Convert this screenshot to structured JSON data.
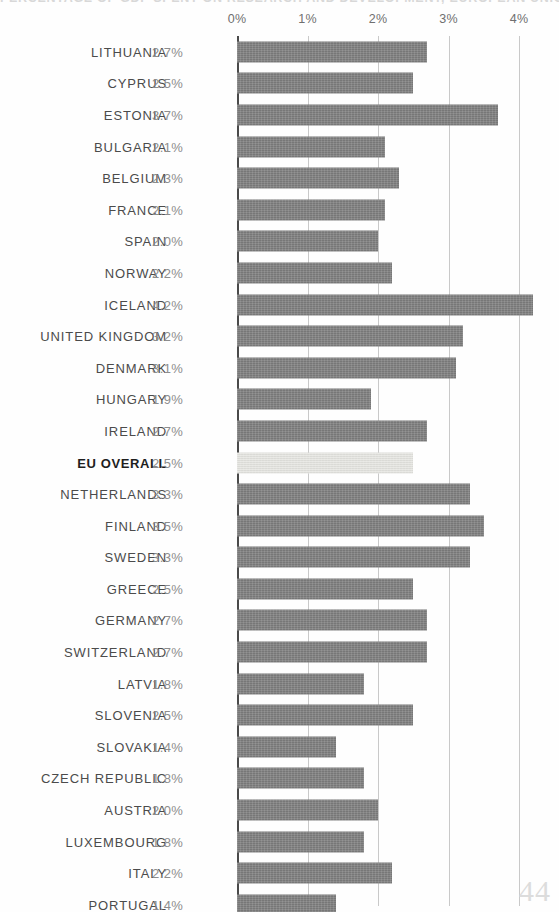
{
  "title": "PERCENTAGE OF GDP SPENT ON RESEARCH AND DEVELOPMENT, EUROPEAN UNION 2012",
  "page_number": "44",
  "axis": {
    "tick_labels": [
      "0%",
      "1%",
      "2%",
      "3%",
      "4%"
    ],
    "tick_values": [
      0,
      1,
      2,
      3,
      4
    ],
    "min": 0,
    "max": 4.45
  },
  "colors": {
    "bar": "#7d7d7d",
    "bar_highlight": "#e6e6e2",
    "gridline": "#c9c9c9",
    "axis_zero": "#4a4a4a",
    "label": "#4b4b4b",
    "value": "#8d8d8d",
    "page_number": "#dcdcdc"
  },
  "chart_data": {
    "type": "bar",
    "orientation": "horizontal",
    "title": "PERCENTAGE OF GDP SPENT ON RESEARCH AND DEVELOPMENT, EUROPEAN UNION 2012",
    "xlabel": "",
    "ylabel": "",
    "xlim": [
      0,
      4.45
    ],
    "grid": true,
    "legend": false,
    "value_suffix": "%",
    "categories": [
      "LITHUANIA",
      "CYPRUS",
      "ESTONIA",
      "BULGARIA",
      "BELGIUM",
      "FRANCE",
      "SPAIN",
      "NORWAY",
      "ICELAND",
      "UNITED KINGDOM",
      "DENMARK",
      "HUNGARY",
      "IRELAND",
      "EU OVERALL",
      "NETHERLANDS",
      "FINLAND",
      "SWEDEN",
      "GREECE",
      "GERMANY",
      "SWITZERLAND",
      "LATVIA",
      "SLOVENIA",
      "SLOVAKIA",
      "CZECH REPUBLIC",
      "AUSTRIA",
      "LUXEMBOURG",
      "ITALY",
      "PORTUGAL"
    ],
    "values": [
      2.7,
      2.5,
      3.7,
      2.1,
      2.3,
      2.1,
      2.0,
      2.2,
      4.2,
      3.2,
      3.1,
      1.9,
      2.7,
      2.5,
      3.3,
      3.5,
      3.3,
      2.5,
      2.7,
      2.7,
      1.8,
      2.5,
      1.4,
      1.8,
      2.0,
      1.8,
      2.2,
      1.4
    ],
    "value_labels": [
      "2.7%",
      "2.5%",
      "3.7%",
      "2.1%",
      "2.3%",
      "2.1%",
      "2.0%",
      "2.2%",
      "4.2%",
      "3.2%",
      "3.1%",
      "1.9%",
      "2.7%",
      "2.5%",
      "3.3%",
      "3.5%",
      "3.3%",
      "2.5%",
      "2.7%",
      "2.7%",
      "1.8%",
      "2.5%",
      "1.4%",
      "1.8%",
      "2.0%",
      "1.8%",
      "2.2%",
      "1.4%"
    ],
    "highlighted_index": 13
  }
}
